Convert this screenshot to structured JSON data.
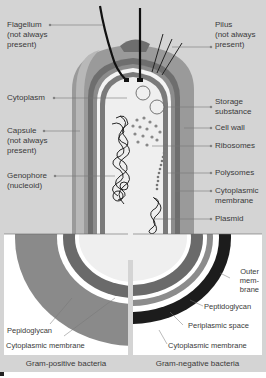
{
  "diagram": {
    "colors": {
      "background": "#d4d4d4",
      "capsule": "#9a9a9a",
      "capsule_highlight": "#b8b8b8",
      "cell_wall": "#6e6e6e",
      "membrane": "#8c8c8c",
      "cytoplasm": "#efefef",
      "dark": "#1c1c1c",
      "inset_bg": "#ffffff"
    },
    "left_labels": [
      {
        "id": "flagellum",
        "text": "Flagellum\n(not always\npresent)"
      },
      {
        "id": "cytoplasm",
        "text": "Cytoplasm"
      },
      {
        "id": "capsule",
        "text": "Capsule\n(not always\npresent)"
      },
      {
        "id": "genophore",
        "text": "Genophore\n(nucleoid)"
      }
    ],
    "right_labels": [
      {
        "id": "pilus",
        "text": "Pilus\n(not always\npresent)"
      },
      {
        "id": "storage",
        "text": "Storage\nsubstance"
      },
      {
        "id": "cell_wall",
        "text": "Cell wall"
      },
      {
        "id": "ribosomes",
        "text": "Ribosomes"
      },
      {
        "id": "polysomes",
        "text": "Polysomes"
      },
      {
        "id": "cyto_membrane",
        "text": "Cytoplasmic\nmembrane"
      },
      {
        "id": "plasmid",
        "text": "Plasmid"
      }
    ],
    "insets": {
      "gram_positive": {
        "caption": "Gram-positive bacteria",
        "labels": [
          "Pepidoglycan",
          "Cytoplasmic membrane"
        ]
      },
      "gram_negative": {
        "caption": "Gram-negative bacteria",
        "labels": [
          "Outer\nmem-\nbrane",
          "Peptidoglycan",
          "Periplasmic space",
          "Cytoplasmic membrane"
        ]
      }
    }
  }
}
